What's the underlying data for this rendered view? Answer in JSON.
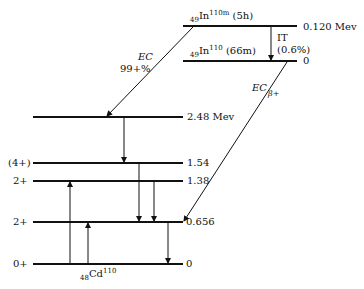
{
  "parent": {
    "metastable": {
      "z": "49",
      "symbol": "In",
      "mass": "110m",
      "halflife": "(5h)",
      "energy": "0.120 Mev"
    },
    "ground": {
      "z": "49",
      "symbol": "In",
      "mass": "110",
      "halflife": "(66m)",
      "energy": "0"
    }
  },
  "transitions": {
    "it": {
      "label": "IT",
      "branch": "(0.6%)"
    },
    "ec_meta": {
      "label": "EC",
      "branch": "99+%"
    },
    "ec_ground": {
      "label": "EC",
      "mode2": "β+"
    }
  },
  "daughter": {
    "nucleus": {
      "z": "48",
      "symbol": "Cd",
      "mass": "110"
    },
    "levels": [
      {
        "spin": "",
        "energy": "2.48 Mev"
      },
      {
        "spin": "(4+)",
        "energy": "1.54"
      },
      {
        "spin": "2+",
        "energy": "1.38"
      },
      {
        "spin": "2+",
        "energy": "0.656"
      },
      {
        "spin": "0+",
        "energy": "0"
      }
    ]
  }
}
